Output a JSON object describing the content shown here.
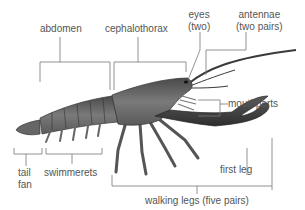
{
  "diagram": {
    "labels": {
      "abdomen": "abdomen",
      "cephalothorax": "cephalothorax",
      "eyes_line1": "eyes",
      "eyes_line2": "(two)",
      "antennae_line1": "antennae",
      "antennae_line2": "(two pairs)",
      "mouthparts": "mouthparts",
      "tail_fan_line1": "tail",
      "tail_fan_line2": "fan",
      "swimmerets": "swimmerets",
      "first_leg": "first leg",
      "walking_legs": "walking legs (five pairs)"
    },
    "colors": {
      "leader_line": "#777777",
      "label_text": "#555555",
      "body_dark": "#3a3a3a",
      "body_mid": "#6b6b6b",
      "body_light": "#9a9a9a"
    }
  }
}
